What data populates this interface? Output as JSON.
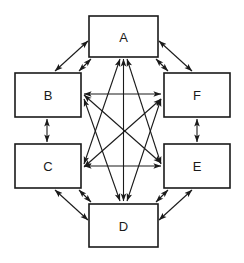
{
  "diagram": {
    "type": "node-link-diagram",
    "canvas": {
      "width": 244,
      "height": 263,
      "background": "#ffffff"
    },
    "style": {
      "node_fill": "#ffffff",
      "node_stroke": "#1a1a1a",
      "edge_color": "#1a1a1a",
      "label_color": "#1a1a1a"
    },
    "nodes": [
      {
        "id": "A",
        "label": "A",
        "x": 89,
        "y": 16,
        "w": 69,
        "h": 41,
        "cx": 123.5,
        "cy": 36.5
      },
      {
        "id": "B",
        "label": "B",
        "x": 15,
        "y": 73,
        "w": 66,
        "h": 44,
        "cx": 48,
        "cy": 95
      },
      {
        "id": "C",
        "label": "C",
        "x": 15,
        "y": 144,
        "w": 66,
        "h": 44,
        "cx": 48,
        "cy": 166
      },
      {
        "id": "D",
        "label": "D",
        "x": 89,
        "y": 204,
        "w": 69,
        "h": 43,
        "cx": 123.5,
        "cy": 225.5
      },
      {
        "id": "E",
        "label": "E",
        "x": 164,
        "y": 144,
        "w": 66,
        "h": 44,
        "cx": 197,
        "cy": 166
      },
      {
        "id": "F",
        "label": "F",
        "x": 164,
        "y": 73,
        "w": 66,
        "h": 44,
        "cx": 197,
        "cy": 95
      }
    ],
    "edges": [
      {
        "from": "B",
        "to": "A",
        "kind": "perimeter-diagonal",
        "bidirectional": true
      },
      {
        "from": "A",
        "to": "F",
        "kind": "perimeter-diagonal",
        "bidirectional": true
      },
      {
        "from": "B",
        "to": "C",
        "kind": "perimeter-vertical",
        "bidirectional": true
      },
      {
        "from": "F",
        "to": "E",
        "kind": "perimeter-vertical",
        "bidirectional": true
      },
      {
        "from": "C",
        "to": "D",
        "kind": "perimeter-diagonal",
        "bidirectional": true
      },
      {
        "from": "D",
        "to": "E",
        "kind": "perimeter-diagonal",
        "bidirectional": true
      },
      {
        "from": "B",
        "to": "F",
        "kind": "cross-horizontal",
        "bidirectional": true
      },
      {
        "from": "C",
        "to": "E",
        "kind": "cross-horizontal",
        "bidirectional": true
      },
      {
        "from": "A",
        "to": "C",
        "kind": "cross-diagonal",
        "bidirectional": true
      },
      {
        "from": "A",
        "to": "E",
        "kind": "cross-diagonal",
        "bidirectional": true
      },
      {
        "from": "A",
        "to": "D",
        "kind": "cross-vertical",
        "bidirectional": true
      },
      {
        "from": "D",
        "to": "B",
        "kind": "cross-diagonal",
        "bidirectional": true
      },
      {
        "from": "D",
        "to": "F",
        "kind": "cross-diagonal",
        "bidirectional": true
      },
      {
        "from": "B",
        "to": "E",
        "kind": "cross-diagonal",
        "bidirectional": true
      },
      {
        "from": "C",
        "to": "F",
        "kind": "cross-diagonal",
        "bidirectional": true
      }
    ]
  }
}
